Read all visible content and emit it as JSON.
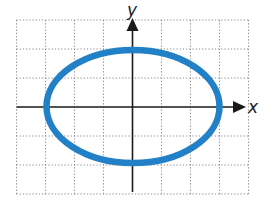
{
  "chart_data": {
    "type": "line",
    "title": "",
    "equation": "x^2/9 + y^2/4 = 1",
    "curve": {
      "shape": "ellipse",
      "center": [
        0,
        0
      ],
      "semi_axis_x": 3,
      "semi_axis_y": 2,
      "intercepts": {
        "x": [
          [
            -3,
            0
          ],
          [
            3,
            0
          ]
        ],
        "y": [
          [
            0,
            2
          ],
          [
            0,
            -2
          ]
        ]
      },
      "color": "#2280c6"
    },
    "xlabel": "x",
    "ylabel": "y",
    "xlim": [
      -4,
      4
    ],
    "ylim": [
      -3,
      3
    ],
    "grid": true,
    "grid_style": "dotted",
    "grid_step": 1,
    "tick_labels": false,
    "legend": null
  },
  "colors": {
    "curve": "#2280c6",
    "axis": "#1a1a1a",
    "grid": "#8a8a8a",
    "background": "#ffffff"
  },
  "axes": {
    "x_label": "x",
    "y_label": "y"
  }
}
